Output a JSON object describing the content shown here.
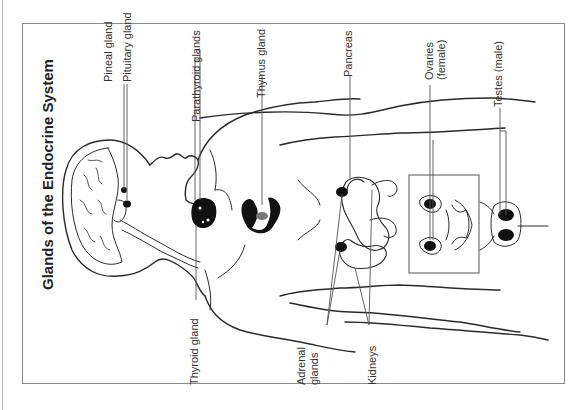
{
  "title": "Glands of the Endocrine System",
  "labels": {
    "pineal": "Pineal gland",
    "pituitary": "Pituitary gland",
    "thyroid": "Thyroid gland",
    "parathyroid": "Parathyroid glands",
    "thymus": "Thymus gland",
    "pancreas": "Pancreas",
    "adrenal_line1": "Adrenal",
    "adrenal_line2": "glands",
    "kidneys": "Kidneys",
    "ovaries_line1": "Ovaries",
    "ovaries_line2": "(female)",
    "testes": "Testes (male)"
  },
  "colors": {
    "line": "#2a2a2a",
    "leader": "#555555",
    "frame": "#8a8a8a",
    "gland_fill": "#111111",
    "thymus_center": "#777777"
  }
}
